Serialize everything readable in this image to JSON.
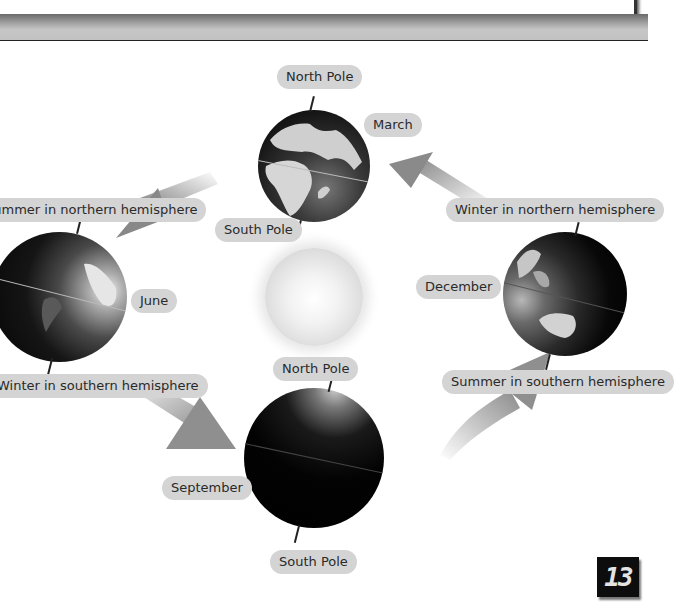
{
  "diagram": {
    "sun": {
      "label": "Sun"
    },
    "positions": [
      {
        "month": "March",
        "north_pole": "North Pole",
        "south_pole": "South Pole"
      },
      {
        "month": "June",
        "north_caption": "Summer in northern hemisphere",
        "south_caption": "Winter in southern hemisphere"
      },
      {
        "month": "September",
        "north_pole": "North Pole",
        "south_pole": "South Pole"
      },
      {
        "month": "December",
        "north_caption": "Winter in northern hemisphere",
        "south_caption": "Summer in southern hemisphere"
      }
    ],
    "orbit_direction": "counter-clockwise (March → June → September → December → March)"
  },
  "labels": {
    "march_north_pole": "North Pole",
    "march_month": "March",
    "march_south_pole": "South Pole",
    "june_north": "Summer in northern hemisphere",
    "june_month": "June",
    "june_south": "Winter in southern hemisphere",
    "sept_north_pole": "North Pole",
    "sept_month": "September",
    "sept_south_pole": "South Pole",
    "dec_north": "Winter in northern hemisphere",
    "dec_month": "December",
    "dec_south": "Summer in southern hemisphere"
  },
  "page": {
    "number": "13"
  },
  "colors": {
    "label_bg": "#d4d4d4",
    "label_text": "#2a2a2a",
    "globe_dark": "#050505",
    "land": "#d8d8d8",
    "arrow": "#8c8c8c"
  }
}
